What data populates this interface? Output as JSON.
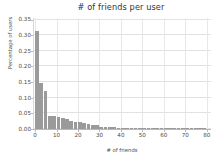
{
  "chart_data": {
    "type": "bar",
    "title": "# of friends per user",
    "xlabel": "# of friends",
    "ylabel": "Percentage of users",
    "xlim": [
      -1,
      82
    ],
    "ylim": [
      0.0,
      0.355
    ],
    "grid": true,
    "legend": null,
    "bar_color": "#9a9a9a",
    "bin_width": 2,
    "xticks": [
      0,
      10,
      20,
      30,
      40,
      50,
      60,
      70,
      80
    ],
    "xtick_labels": [
      "0",
      "10",
      "20",
      "30",
      "40",
      "50",
      "60",
      "70",
      "80"
    ],
    "yticks": [
      0.0,
      0.05,
      0.1,
      0.15,
      0.2,
      0.25,
      0.3,
      0.35
    ],
    "ytick_labels": [
      "0.00",
      "0.05",
      "0.10",
      "0.15",
      "0.20",
      "0.25",
      "0.30",
      "0.35"
    ],
    "x": [
      1,
      3,
      5,
      7,
      9,
      11,
      13,
      15,
      17,
      19,
      21,
      23,
      25,
      27,
      29,
      31,
      33,
      35,
      37,
      39,
      41,
      43,
      45,
      47,
      49,
      51,
      53,
      55,
      57,
      59,
      61,
      63,
      65,
      67,
      69,
      71,
      73,
      75,
      77,
      79
    ],
    "values": [
      0.315,
      0.148,
      0.122,
      0.043,
      0.041,
      0.039,
      0.036,
      0.033,
      0.025,
      0.024,
      0.021,
      0.018,
      0.016,
      0.013,
      0.012,
      0.008,
      0.006,
      0.005,
      0.005,
      0.004,
      0.004,
      0.004,
      0.003,
      0.003,
      0.003,
      0.002,
      0.002,
      0.002,
      0.002,
      0.002,
      0.001,
      0.001,
      0.001,
      0.001,
      0.001,
      0.001,
      0.001,
      0.001,
      0.001,
      0.001
    ],
    "categories": [
      "1",
      "3",
      "5",
      "7",
      "9",
      "11",
      "13",
      "15",
      "17",
      "19",
      "21",
      "23",
      "25",
      "27",
      "29",
      "31",
      "33",
      "35",
      "37",
      "39",
      "41",
      "43",
      "45",
      "47",
      "49",
      "51",
      "53",
      "55",
      "57",
      "59",
      "61",
      "63",
      "65",
      "67",
      "69",
      "71",
      "73",
      "75",
      "77",
      "79"
    ]
  }
}
